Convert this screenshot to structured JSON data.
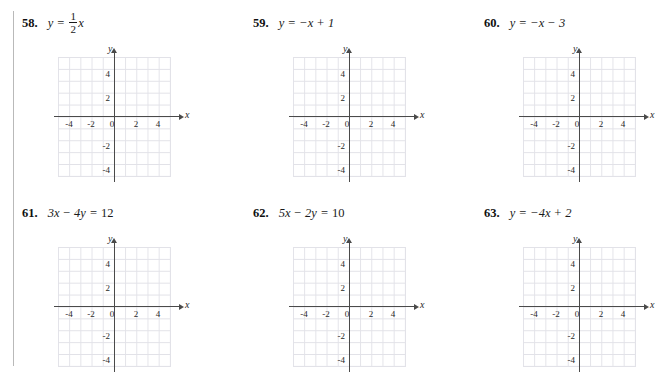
{
  "page": {
    "margin_rule": true,
    "background": "#ffffff",
    "grid_color": "#e2e2e8",
    "axis_color": "#4a4a4a",
    "text_color": "#1a1a1a"
  },
  "axes": {
    "x_label": "x",
    "y_label": "y",
    "origin_label": "0",
    "x_ticks": [
      "-4",
      "-2",
      "2",
      "4"
    ],
    "y_ticks": [
      "4",
      "2",
      "-2",
      "-4"
    ],
    "x_range": [
      -5,
      5
    ],
    "y_range": [
      -5,
      5
    ],
    "tick_step": 2,
    "grid_step": 1
  },
  "problems": [
    {
      "number": "58.",
      "equation_plain": "y = 1/2 x",
      "lhs": "y",
      "eq": "=",
      "fraction": {
        "numerator": "1",
        "denominator": "2"
      },
      "trailing": "x",
      "has_fraction": true
    },
    {
      "number": "59.",
      "equation_plain": "y = -x + 1",
      "lhs": "y",
      "eq": "=",
      "rhs": "−x + 1",
      "has_fraction": false
    },
    {
      "number": "60.",
      "equation_plain": "y = -x - 3",
      "lhs": "y",
      "eq": "=",
      "rhs": "−x − 3",
      "has_fraction": false
    },
    {
      "number": "61.",
      "equation_plain": "3x - 4y = 12",
      "lhs": "3x − 4y",
      "eq": "=",
      "rhs": "12",
      "has_fraction": false
    },
    {
      "number": "62.",
      "equation_plain": "5x - 2y = 10",
      "lhs": "5x − 2y",
      "eq": "=",
      "rhs": "10",
      "has_fraction": false
    },
    {
      "number": "63.",
      "equation_plain": "y = -4x + 2",
      "lhs": "y",
      "eq": "=",
      "rhs": "−4x + 2",
      "has_fraction": false
    }
  ]
}
